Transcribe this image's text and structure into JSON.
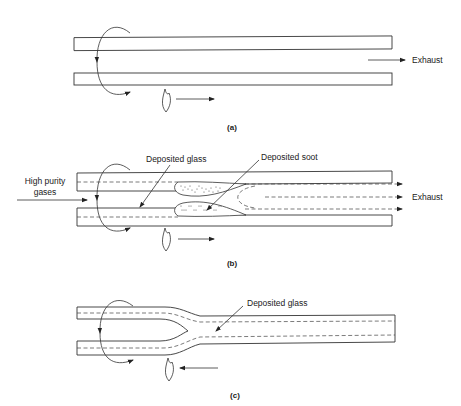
{
  "panels": [
    {
      "id": "a",
      "caption": "(a)",
      "labels": {
        "exhaust": "Exhaust"
      },
      "torch_direction": "right"
    },
    {
      "id": "b",
      "caption": "(b)",
      "labels": {
        "inlet": [
          "High purity",
          "gases"
        ],
        "deposited_glass": "Deposited glass",
        "deposited_soot": "Deposited soot",
        "exhaust": "Exhaust"
      },
      "torch_direction": "right"
    },
    {
      "id": "c",
      "caption": "(c)",
      "labels": {
        "deposited_glass": "Deposited glass"
      },
      "torch_direction": "left"
    }
  ],
  "icons": {
    "rotation": "rotation-arrow-icon",
    "torch": "flame-icon"
  }
}
